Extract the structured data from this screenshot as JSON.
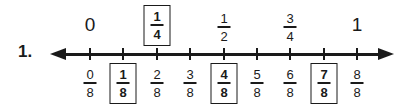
{
  "problem_number": "1.",
  "number_line": {
    "direction": "bidirectional-arrow",
    "tick_count": 9,
    "top_labels": [
      {
        "type": "whole",
        "text": "0",
        "position": 0,
        "boxed": false
      },
      {
        "type": "fraction",
        "numerator": "1",
        "denominator": "4",
        "position": 2,
        "boxed": true
      },
      {
        "type": "fraction",
        "numerator": "1",
        "denominator": "2",
        "position": 4,
        "boxed": false
      },
      {
        "type": "fraction",
        "numerator": "3",
        "denominator": "4",
        "position": 6,
        "boxed": false
      },
      {
        "type": "whole",
        "text": "1",
        "position": 8,
        "boxed": false
      }
    ],
    "bottom_labels": [
      {
        "numerator": "0",
        "denominator": "8",
        "boxed": false
      },
      {
        "numerator": "1",
        "denominator": "8",
        "boxed": true
      },
      {
        "numerator": "2",
        "denominator": "8",
        "boxed": false
      },
      {
        "numerator": "3",
        "denominator": "8",
        "boxed": false
      },
      {
        "numerator": "4",
        "denominator": "8",
        "boxed": true
      },
      {
        "numerator": "5",
        "denominator": "8",
        "boxed": false
      },
      {
        "numerator": "6",
        "denominator": "8",
        "boxed": false
      },
      {
        "numerator": "7",
        "denominator": "8",
        "boxed": true
      },
      {
        "numerator": "8",
        "denominator": "8",
        "boxed": false
      }
    ]
  },
  "colors": {
    "ink": "#1a1a1a",
    "background": "#ffffff"
  }
}
